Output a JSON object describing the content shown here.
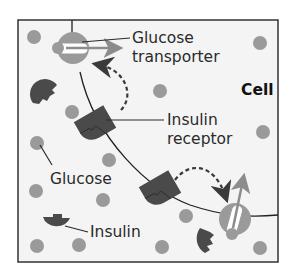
{
  "diagram": {
    "type": "biology-illustration",
    "labels": {
      "glucose_transporter_line1": "Glucose",
      "glucose_transporter_line2": "transporter",
      "cell": "Cell",
      "insulin_receptor_line1": "Insulin",
      "insulin_receptor_line2": "receptor",
      "glucose": "Glucose",
      "insulin": "Insulin"
    },
    "colors": {
      "background": "#f4f4f4",
      "frame": "#333333",
      "membrane": "#222222",
      "glucose": "#9a9a9a",
      "insulin": "#4a4a4a",
      "receptor": "#4a4a4a",
      "transporter_body": "#9a9a9a",
      "transporter_channel": "#ffffff",
      "arrow": "#8c8c8c",
      "dashed_arrow": "#3a3a3a"
    },
    "elements": {
      "glucose_transporters": 2,
      "insulin_receptors": 2,
      "free_insulin_molecules": 3,
      "glucose_molecules": 14
    }
  }
}
